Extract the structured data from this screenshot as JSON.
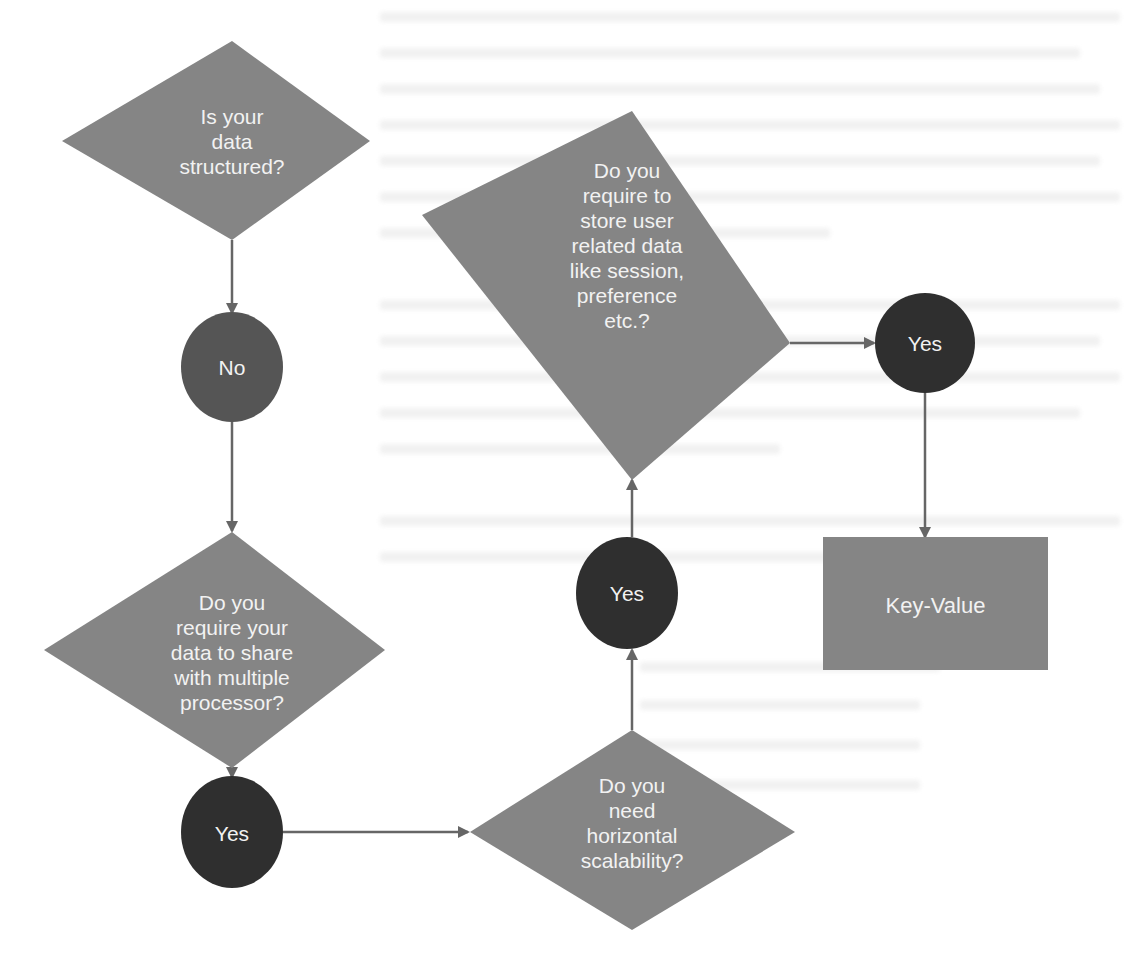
{
  "colors": {
    "decision_fill": "#858585",
    "terminal_fill": "#2f2f2f",
    "no_fill": "#555555",
    "process_fill": "#858585",
    "arrow": "#666666",
    "label_text": "#f2f2f2",
    "background": "#ffffff"
  },
  "flowchart": {
    "nodes": [
      {
        "id": "d1",
        "type": "decision",
        "label": "Is your\ndata\nstructured?"
      },
      {
        "id": "no1",
        "type": "terminal",
        "label": "No"
      },
      {
        "id": "d2",
        "type": "decision",
        "label": "Do you\nrequire your\ndata to share\nwith multiple\nprocessor?"
      },
      {
        "id": "yes1",
        "type": "terminal",
        "label": "Yes"
      },
      {
        "id": "d3",
        "type": "decision",
        "label": "Do you\nneed\nhorizontal\nscalability?"
      },
      {
        "id": "yes2",
        "type": "terminal",
        "label": "Yes"
      },
      {
        "id": "d4",
        "type": "decision",
        "label": "Do you\nrequire to\nstore user\nrelated data\nlike session,\npreference\netc.?"
      },
      {
        "id": "yes3",
        "type": "terminal",
        "label": "Yes"
      },
      {
        "id": "kv",
        "type": "process",
        "label": "Key-Value"
      }
    ],
    "edges": [
      {
        "from": "d1",
        "to": "no1"
      },
      {
        "from": "no1",
        "to": "d2"
      },
      {
        "from": "d2",
        "to": "yes1"
      },
      {
        "from": "yes1",
        "to": "d3"
      },
      {
        "from": "d3",
        "to": "yes2"
      },
      {
        "from": "yes2",
        "to": "d4"
      },
      {
        "from": "d4",
        "to": "yes3"
      },
      {
        "from": "yes3",
        "to": "kv"
      }
    ]
  }
}
